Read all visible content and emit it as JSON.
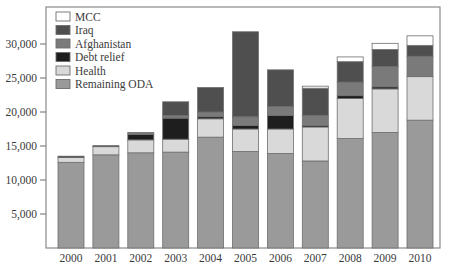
{
  "chart_data": {
    "type": "bar",
    "stacked": true,
    "title": "",
    "xlabel": "",
    "ylabel": "",
    "ylim": [
      0,
      35000
    ],
    "yticks": [
      5000,
      10000,
      15000,
      20000,
      25000,
      30000
    ],
    "ytick_labels": [
      "5,000",
      "10,000",
      "15,000",
      "20,000",
      "25,000",
      "30,000"
    ],
    "grid": false,
    "legend_position": "upper-left-inside",
    "categories": [
      "2000",
      "2001",
      "2002",
      "2003",
      "2004",
      "2005",
      "2006",
      "2007",
      "2008",
      "2009",
      "2010"
    ],
    "series": [
      {
        "name": "Remaining ODA",
        "color": "#9a9a9a",
        "values": [
          12600,
          13700,
          14000,
          14100,
          16300,
          14200,
          13900,
          12800,
          16100,
          17000,
          18800
        ]
      },
      {
        "name": "Health",
        "color": "#d9d9d9",
        "values": [
          700,
          1200,
          1900,
          1900,
          2700,
          3300,
          3600,
          5000,
          5900,
          6400,
          6400
        ]
      },
      {
        "name": "Debt relief",
        "color": "#1e1e1e",
        "values": [
          200,
          150,
          800,
          3100,
          300,
          500,
          2000,
          200,
          400,
          300,
          0
        ]
      },
      {
        "name": "Afghanistan",
        "color": "#7a7a7a",
        "values": [
          0,
          0,
          300,
          400,
          700,
          1300,
          1300,
          1500,
          2000,
          3000,
          3000
        ]
      },
      {
        "name": "Iraq",
        "color": "#4f4f4f",
        "values": [
          0,
          0,
          0,
          2000,
          3600,
          12500,
          5400,
          4000,
          3000,
          2500,
          1600
        ]
      },
      {
        "name": "MCC",
        "color": "#ffffff",
        "values": [
          0,
          0,
          0,
          0,
          0,
          0,
          0,
          300,
          700,
          900,
          1400
        ]
      }
    ],
    "legend_order": [
      "MCC",
      "Iraq",
      "Afghanistan",
      "Debt relief",
      "Health",
      "Remaining ODA"
    ]
  }
}
